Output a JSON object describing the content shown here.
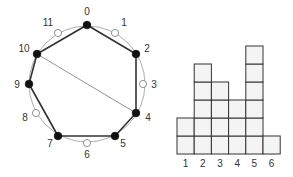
{
  "circle_diagram": {
    "center": [
      87,
      84
    ],
    "radius": 58,
    "nodes": [
      {
        "label": "0",
        "x": 87,
        "y": 25,
        "filled": true,
        "lx": 87,
        "ly": 15
      },
      {
        "label": "1",
        "x": 115,
        "y": 33,
        "filled": false,
        "lx": 124,
        "ly": 26
      },
      {
        "label": "2",
        "x": 136,
        "y": 54,
        "filled": true,
        "lx": 147,
        "ly": 52
      },
      {
        "label": "3",
        "x": 143,
        "y": 84,
        "filled": false,
        "lx": 154,
        "ly": 88
      },
      {
        "label": "4",
        "x": 136,
        "y": 113,
        "filled": true,
        "lx": 148,
        "ly": 121
      },
      {
        "label": "5",
        "x": 115,
        "y": 136,
        "filled": true,
        "lx": 123,
        "ly": 147
      },
      {
        "label": "6",
        "x": 87,
        "y": 143,
        "filled": false,
        "lx": 87,
        "ly": 158
      },
      {
        "label": "7",
        "x": 58,
        "y": 136,
        "filled": true,
        "lx": 50,
        "ly": 147
      },
      {
        "label": "8",
        "x": 36,
        "y": 113,
        "filled": false,
        "lx": 25,
        "ly": 121
      },
      {
        "label": "9",
        "x": 29,
        "y": 84,
        "filled": true,
        "lx": 17,
        "ly": 88
      },
      {
        "label": "10",
        "x": 37,
        "y": 54,
        "filled": true,
        "lx": 24,
        "ly": 52
      },
      {
        "label": "11",
        "x": 58,
        "y": 33,
        "filled": false,
        "lx": 48,
        "ly": 26
      }
    ],
    "polygon": [
      "0",
      "2",
      "4",
      "5",
      "7",
      "9",
      "10"
    ],
    "chord": [
      "10",
      "4"
    ]
  },
  "histogram": {
    "categories": [
      "1",
      "2",
      "3",
      "4",
      "5",
      "6"
    ],
    "values": [
      2,
      5,
      4,
      3,
      6,
      1
    ],
    "x0": 177,
    "baseline": 154,
    "cell_w": 17.2,
    "cell_h": 18
  },
  "colors": {
    "stroke": "#333333",
    "circle": "#999999",
    "cell_fill": "#f4f4f4"
  }
}
